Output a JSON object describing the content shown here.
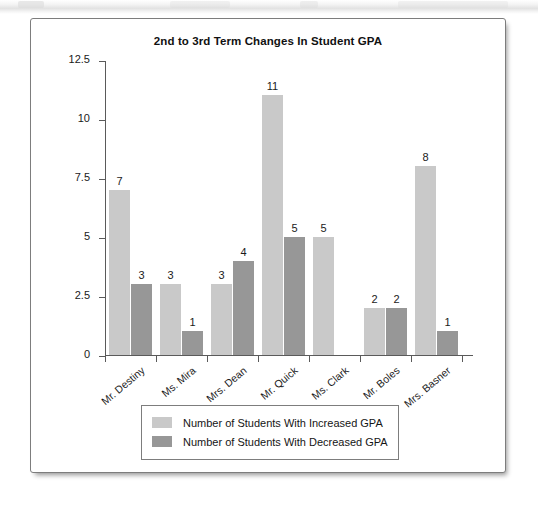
{
  "chart_data": {
    "type": "bar",
    "title": "2nd to 3rd Term Changes In Student GPA",
    "xlabel": "",
    "ylabel": "",
    "ylim": [
      0,
      12.5
    ],
    "yticks": [
      "0",
      "2.5",
      "5",
      "7.5",
      "10",
      "12.5"
    ],
    "ytick_values": [
      0,
      2.5,
      5,
      7.5,
      10,
      12.5
    ],
    "grid": false,
    "legend_position": "bottom",
    "categories": [
      "Mr. Destiny",
      "Ms. Mira",
      "Mrs. Dean",
      "Mr. Quick",
      "Ms. Clark",
      "Mr. Boles",
      "Mrs. Basner"
    ],
    "series": [
      {
        "name": "Number of Students With Increased GPA",
        "color": "#c9c9c9",
        "values": [
          7,
          3,
          3,
          11,
          5,
          2,
          8
        ],
        "labels": [
          "7",
          "3",
          "3",
          "11",
          "5",
          "2",
          "8"
        ]
      },
      {
        "name": "Number of Students With Decreased GPA",
        "color": "#979797",
        "values": [
          3,
          1,
          4,
          5,
          null,
          2,
          1
        ],
        "labels": [
          "3",
          "1",
          "4",
          "5",
          "",
          "2",
          "1"
        ]
      }
    ]
  },
  "legend": {
    "items": [
      {
        "label": "Number of Students With Increased GPA",
        "swatch": "increased"
      },
      {
        "label": "Number of Students With Decreased GPA",
        "swatch": "decreased"
      }
    ]
  }
}
